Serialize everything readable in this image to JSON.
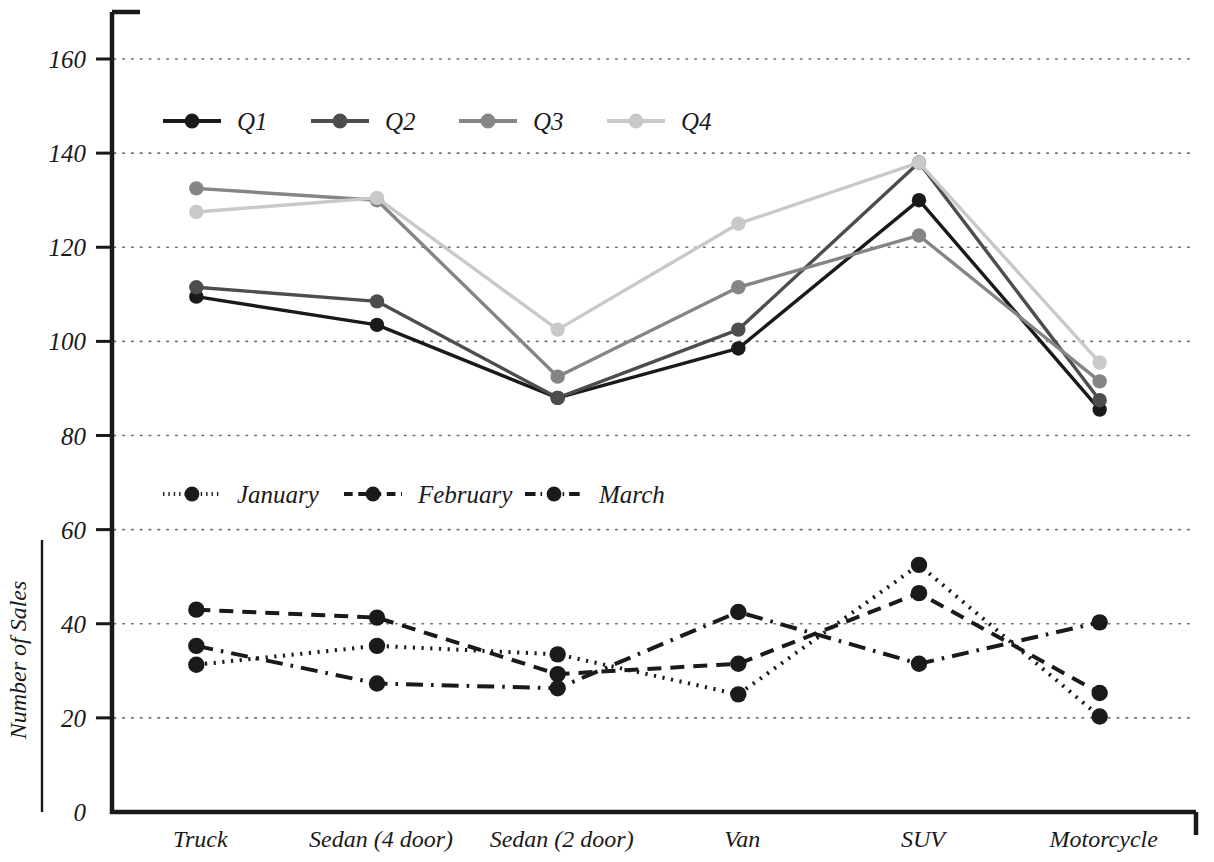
{
  "chart_data": {
    "type": "line",
    "title": "",
    "xlabel": "",
    "ylabel": "Number of Sales",
    "categories": [
      "Truck",
      "Sedan (4 door)",
      "Sedan (2 door)",
      "Van",
      "SUV",
      "Motorcycle"
    ],
    "ylim": [
      0,
      170
    ],
    "yticks": [
      0,
      20,
      40,
      60,
      80,
      100,
      120,
      140,
      160
    ],
    "ytick_labels": [
      "0",
      "20",
      "40",
      "60",
      "80",
      "100",
      "120",
      "140",
      "160"
    ],
    "grid": "horizontal-dotted",
    "legend_position": "inside-upper-left (two stacked legend blocks)",
    "series": [
      {
        "name": "Q1",
        "values": [
          109.5,
          103.5,
          88.0,
          98.5,
          130.0,
          85.5
        ],
        "color": "#1a1a1a",
        "dash": "solid",
        "marker": "circle"
      },
      {
        "name": "Q2",
        "values": [
          111.5,
          108.5,
          88.0,
          102.5,
          138.0,
          87.5
        ],
        "color": "#4d4d4d",
        "dash": "solid",
        "marker": "circle"
      },
      {
        "name": "Q3",
        "values": [
          132.5,
          130.0,
          92.5,
          111.5,
          122.5,
          91.5
        ],
        "color": "#858585",
        "dash": "solid",
        "marker": "circle"
      },
      {
        "name": "Q4",
        "values": [
          127.5,
          130.5,
          102.5,
          125.0,
          138.0,
          95.5
        ],
        "color": "#c9c9c9",
        "dash": "solid",
        "marker": "circle"
      },
      {
        "name": "January",
        "values": [
          31.3,
          35.3,
          33.5,
          25.0,
          52.5,
          20.3
        ],
        "color": "#1a1a1a",
        "dash": "dotted",
        "marker": "circle"
      },
      {
        "name": "February",
        "values": [
          43.0,
          41.3,
          29.3,
          31.5,
          46.5,
          25.3
        ],
        "color": "#1a1a1a",
        "dash": "dashed",
        "marker": "circle"
      },
      {
        "name": "March",
        "values": [
          35.3,
          27.3,
          26.3,
          42.5,
          31.5,
          40.3
        ],
        "color": "#1a1a1a",
        "dash": "dashdot",
        "marker": "circle"
      }
    ]
  },
  "legends": [
    {
      "id": "quarters",
      "entries": [
        "Q1",
        "Q2",
        "Q3",
        "Q4"
      ]
    },
    {
      "id": "months",
      "entries": [
        "January",
        "February",
        "March"
      ]
    }
  ],
  "axes": {
    "y_axis_title": "Number of Sales"
  }
}
